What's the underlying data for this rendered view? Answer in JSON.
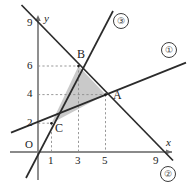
{
  "figure": {
    "kind": "coordinate-plane-line-graph",
    "axes": {
      "x_label": "x",
      "y_label": "y",
      "origin_label": "O"
    },
    "x_ticks": [
      {
        "value": 1,
        "label": "1"
      },
      {
        "value": 3,
        "label": "3"
      },
      {
        "value": 5,
        "label": "5"
      },
      {
        "value": 9,
        "label": "9"
      }
    ],
    "y_ticks": [
      {
        "value": 2,
        "label": "2"
      },
      {
        "value": 4,
        "label": "4"
      },
      {
        "value": 6,
        "label": "6"
      },
      {
        "value": 9,
        "label": "9"
      }
    ],
    "points": [
      {
        "name": "A",
        "label": "A",
        "x": 5,
        "y": 4
      },
      {
        "name": "B",
        "label": "B",
        "x": 3,
        "y": 6
      },
      {
        "name": "C",
        "label": "C",
        "x": 1,
        "y": 2
      }
    ],
    "line_labels": [
      {
        "name": "line-1",
        "label": "①"
      },
      {
        "name": "line-2",
        "label": "②"
      },
      {
        "name": "line-3",
        "label": "③"
      }
    ],
    "shaded_region": {
      "name": "triangle-ABC",
      "vertices": [
        "C",
        "B",
        "A"
      ],
      "fill": "#c8c8c8"
    },
    "colors": {
      "axis": "#8a8a8a",
      "line": "#2b2b2b",
      "guide": "#7a7a7a",
      "fill": "#c9c9c9",
      "text": "#1a1a1a"
    }
  }
}
